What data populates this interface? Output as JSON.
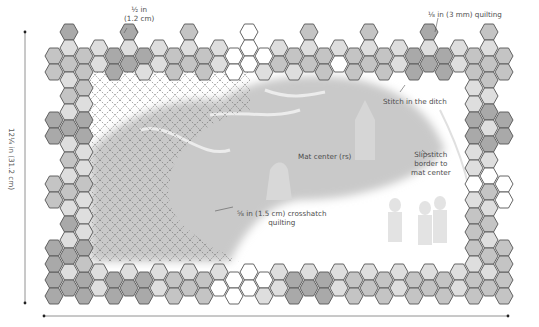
{
  "diagram": {
    "title_fragment": "",
    "labels": {
      "hex_size": "½ in\n(1.2 cm)",
      "hex_size_line1": "½ in",
      "hex_size_line2": "(1.2 cm)",
      "quilting_3mm": "⅛ in (3 mm) quilting",
      "stitch_in_ditch": "Stitch in the ditch",
      "mat_center": "Mat center (rs)",
      "slipstitch_line1": "Slipstitch",
      "slipstitch_line2": "border to",
      "slipstitch_line3": "mat center",
      "crosshatch_line1": "⅝ in (1.5 cm) crosshatch",
      "crosshatch_line2": "quilting",
      "height_dimension": "12¼ in (31.2 cm)"
    },
    "colors": {
      "hex_stroke": "#555555",
      "shade_dark": "#a9a9a9",
      "shade_mid": "#c4c4c4",
      "shade_light": "#dedede",
      "shade_white": "#ffffff",
      "mat_grey": "#c9c9c9",
      "crosshatch": "#6b6b6b",
      "dimension_line": "#777777"
    },
    "hex": {
      "w": 18,
      "h": 16,
      "col_step": 15,
      "row_step": 16,
      "origin_x": 45,
      "origin_y": 32
    },
    "border": {
      "top": [
        [
          0,
          1,
          "m"
        ],
        [
          0,
          2,
          "m"
        ],
        [
          1,
          0,
          "d"
        ],
        [
          1,
          1,
          "l"
        ],
        [
          1,
          2,
          "m"
        ],
        [
          2,
          1,
          "m"
        ],
        [
          2,
          2,
          "m"
        ],
        [
          3,
          1,
          "l"
        ],
        [
          3,
          2,
          "l"
        ],
        [
          4,
          1,
          "d"
        ],
        [
          4,
          2,
          "d"
        ],
        [
          5,
          0,
          "d"
        ],
        [
          5,
          1,
          "l"
        ],
        [
          5,
          2,
          "d"
        ],
        [
          6,
          1,
          "d"
        ],
        [
          6,
          2,
          "l"
        ],
        [
          7,
          1,
          "l"
        ],
        [
          7,
          2,
          "l"
        ],
        [
          8,
          1,
          "m"
        ],
        [
          8,
          2,
          "m"
        ],
        [
          9,
          0,
          "m"
        ],
        [
          9,
          1,
          "l"
        ],
        [
          9,
          2,
          "m"
        ],
        [
          10,
          1,
          "m"
        ],
        [
          10,
          2,
          "m"
        ],
        [
          11,
          1,
          "l"
        ],
        [
          11,
          2,
          "l"
        ],
        [
          12,
          1,
          "w"
        ],
        [
          12,
          2,
          "w"
        ],
        [
          13,
          0,
          "w"
        ],
        [
          13,
          1,
          "w"
        ],
        [
          13,
          2,
          "w"
        ],
        [
          14,
          1,
          "w"
        ],
        [
          14,
          2,
          "l"
        ],
        [
          15,
          1,
          "l"
        ],
        [
          15,
          2,
          "m"
        ],
        [
          16,
          1,
          "m"
        ],
        [
          16,
          2,
          "l"
        ],
        [
          17,
          0,
          "m"
        ],
        [
          17,
          1,
          "l"
        ],
        [
          17,
          2,
          "m"
        ],
        [
          18,
          1,
          "m"
        ],
        [
          18,
          2,
          "m"
        ],
        [
          19,
          1,
          "l"
        ],
        [
          19,
          2,
          "w"
        ],
        [
          20,
          1,
          "m"
        ],
        [
          20,
          2,
          "m"
        ],
        [
          21,
          0,
          "m"
        ],
        [
          21,
          1,
          "l"
        ],
        [
          21,
          2,
          "m"
        ],
        [
          22,
          1,
          "m"
        ],
        [
          22,
          2,
          "m"
        ],
        [
          23,
          1,
          "l"
        ],
        [
          23,
          2,
          "l"
        ],
        [
          24,
          1,
          "d"
        ],
        [
          24,
          2,
          "d"
        ],
        [
          25,
          0,
          "d"
        ],
        [
          25,
          1,
          "l"
        ],
        [
          25,
          2,
          "d"
        ],
        [
          26,
          1,
          "d"
        ],
        [
          26,
          2,
          "d"
        ],
        [
          27,
          1,
          "l"
        ],
        [
          27,
          2,
          "l"
        ],
        [
          28,
          1,
          "m"
        ],
        [
          28,
          2,
          "m"
        ],
        [
          29,
          0,
          "m"
        ],
        [
          29,
          1,
          "l"
        ],
        [
          29,
          2,
          "m"
        ],
        [
          30,
          1,
          "m"
        ],
        [
          30,
          2,
          "m"
        ]
      ],
      "bottom": [
        [
          0,
          15,
          "d"
        ],
        [
          0,
          16,
          "d"
        ],
        [
          1,
          15,
          "l"
        ],
        [
          1,
          16,
          "d"
        ],
        [
          2,
          15,
          "d"
        ],
        [
          2,
          16,
          "d"
        ],
        [
          3,
          15,
          "l"
        ],
        [
          3,
          16,
          "l"
        ],
        [
          4,
          15,
          "d"
        ],
        [
          4,
          16,
          "d"
        ],
        [
          5,
          15,
          "l"
        ],
        [
          5,
          16,
          "d"
        ],
        [
          6,
          15,
          "d"
        ],
        [
          6,
          16,
          "d"
        ],
        [
          7,
          15,
          "l"
        ],
        [
          7,
          16,
          "l"
        ],
        [
          8,
          15,
          "m"
        ],
        [
          8,
          16,
          "m"
        ],
        [
          9,
          15,
          "l"
        ],
        [
          9,
          16,
          "m"
        ],
        [
          10,
          15,
          "m"
        ],
        [
          10,
          16,
          "m"
        ],
        [
          11,
          15,
          "l"
        ],
        [
          11,
          16,
          "w"
        ],
        [
          12,
          15,
          "w"
        ],
        [
          12,
          16,
          "w"
        ],
        [
          13,
          15,
          "w"
        ],
        [
          13,
          16,
          "w"
        ],
        [
          14,
          15,
          "w"
        ],
        [
          14,
          16,
          "l"
        ],
        [
          15,
          15,
          "l"
        ],
        [
          15,
          16,
          "l"
        ],
        [
          16,
          15,
          "d"
        ],
        [
          16,
          16,
          "d"
        ],
        [
          17,
          15,
          "l"
        ],
        [
          17,
          16,
          "d"
        ],
        [
          18,
          15,
          "d"
        ],
        [
          18,
          16,
          "d"
        ],
        [
          19,
          15,
          "l"
        ],
        [
          19,
          16,
          "l"
        ],
        [
          20,
          15,
          "m"
        ],
        [
          20,
          16,
          "m"
        ],
        [
          21,
          15,
          "l"
        ],
        [
          21,
          16,
          "m"
        ],
        [
          22,
          15,
          "m"
        ],
        [
          22,
          16,
          "m"
        ],
        [
          23,
          15,
          "l"
        ],
        [
          23,
          16,
          "l"
        ],
        [
          24,
          15,
          "m"
        ],
        [
          24,
          16,
          "m"
        ],
        [
          25,
          15,
          "l"
        ],
        [
          25,
          16,
          "m"
        ],
        [
          26,
          15,
          "m"
        ],
        [
          26,
          16,
          "m"
        ],
        [
          27,
          15,
          "l"
        ],
        [
          27,
          16,
          "l"
        ],
        [
          28,
          15,
          "m"
        ],
        [
          28,
          16,
          "m"
        ],
        [
          29,
          15,
          "l"
        ],
        [
          29,
          16,
          "m"
        ],
        [
          30,
          15,
          "m"
        ],
        [
          30,
          16,
          "m"
        ]
      ],
      "left": [
        [
          1,
          3,
          "l"
        ],
        [
          2,
          3,
          "m"
        ],
        [
          1,
          4,
          "m"
        ],
        [
          2,
          4,
          "l"
        ],
        [
          0,
          5,
          "d"
        ],
        [
          1,
          5,
          "l"
        ],
        [
          2,
          5,
          "d"
        ],
        [
          0,
          6,
          "d"
        ],
        [
          1,
          6,
          "d"
        ],
        [
          2,
          6,
          "d"
        ],
        [
          1,
          7,
          "l"
        ],
        [
          2,
          7,
          "l"
        ],
        [
          1,
          8,
          "m"
        ],
        [
          2,
          8,
          "l"
        ],
        [
          0,
          9,
          "m"
        ],
        [
          1,
          9,
          "l"
        ],
        [
          2,
          9,
          "m"
        ],
        [
          0,
          10,
          "m"
        ],
        [
          1,
          10,
          "m"
        ],
        [
          2,
          10,
          "l"
        ],
        [
          1,
          11,
          "l"
        ],
        [
          2,
          11,
          "l"
        ],
        [
          1,
          12,
          "d"
        ],
        [
          2,
          12,
          "l"
        ],
        [
          0,
          13,
          "d"
        ],
        [
          1,
          13,
          "l"
        ],
        [
          2,
          13,
          "d"
        ],
        [
          0,
          14,
          "d"
        ],
        [
          1,
          14,
          "d"
        ],
        [
          2,
          14,
          "m"
        ]
      ],
      "right": [
        [
          28,
          3,
          "l"
        ],
        [
          29,
          3,
          "m"
        ],
        [
          28,
          4,
          "l"
        ],
        [
          29,
          4,
          "l"
        ],
        [
          28,
          5,
          "d"
        ],
        [
          29,
          5,
          "d"
        ],
        [
          30,
          5,
          "d"
        ],
        [
          28,
          6,
          "d"
        ],
        [
          29,
          6,
          "l"
        ],
        [
          30,
          6,
          "d"
        ],
        [
          28,
          7,
          "l"
        ],
        [
          29,
          7,
          "d"
        ],
        [
          28,
          8,
          "l"
        ],
        [
          29,
          8,
          "l"
        ],
        [
          28,
          9,
          "w"
        ],
        [
          29,
          9,
          "w"
        ],
        [
          30,
          9,
          "w"
        ],
        [
          28,
          10,
          "l"
        ],
        [
          29,
          10,
          "m"
        ],
        [
          30,
          10,
          "w"
        ],
        [
          28,
          11,
          "m"
        ],
        [
          29,
          11,
          "l"
        ],
        [
          28,
          12,
          "m"
        ],
        [
          29,
          12,
          "m"
        ],
        [
          28,
          13,
          "m"
        ],
        [
          29,
          13,
          "l"
        ],
        [
          30,
          13,
          "m"
        ],
        [
          28,
          14,
          "l"
        ],
        [
          29,
          14,
          "m"
        ],
        [
          30,
          14,
          "m"
        ]
      ]
    }
  }
}
